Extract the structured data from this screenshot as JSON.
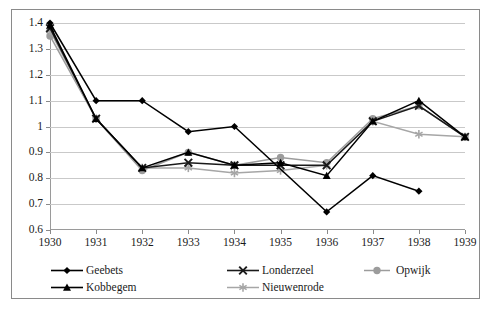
{
  "chart_data": {
    "type": "line",
    "title": "",
    "xlabel": "",
    "ylabel": "",
    "x": [
      1930,
      1931,
      1932,
      1933,
      1934,
      1935,
      1936,
      1937,
      1938,
      1939
    ],
    "xtick_labels": [
      "1930",
      "1931",
      "1932",
      "1933",
      "1934",
      "1935",
      "1936",
      "1937",
      "1938",
      "1939"
    ],
    "ytick_labels": [
      "0.6",
      "0.7",
      "0.8",
      "0.9",
      "1",
      "1.1",
      "1.2",
      "1.3",
      "1.4"
    ],
    "ytick_values": [
      0.6,
      0.7,
      0.8,
      0.9,
      1.0,
      1.1,
      1.2,
      1.3,
      1.4
    ],
    "ylim": [
      0.6,
      1.4
    ],
    "xlim": [
      1930,
      1939
    ],
    "grid": true,
    "legend_position": "bottom",
    "series": [
      {
        "name": "Geebets",
        "marker": "diamond",
        "color": "#000000",
        "x": [
          1930,
          1931,
          1932,
          1933,
          1934,
          1936,
          1937,
          1938
        ],
        "values": [
          1.4,
          1.1,
          1.1,
          0.98,
          1.0,
          0.67,
          0.81,
          0.75
        ]
      },
      {
        "name": "Kobbegem",
        "marker": "triangle",
        "color": "#000000",
        "x": [
          1930,
          1931,
          1932,
          1933,
          1934,
          1935,
          1936,
          1937,
          1938,
          1939
        ],
        "values": [
          1.39,
          1.03,
          0.84,
          0.9,
          0.85,
          0.86,
          0.81,
          1.02,
          1.1,
          0.96
        ]
      },
      {
        "name": "Londerzeel",
        "marker": "x",
        "color": "#1a1a1a",
        "x": [
          1930,
          1931,
          1932,
          1933,
          1934,
          1935,
          1936,
          1937,
          1938,
          1939
        ],
        "values": [
          1.38,
          1.03,
          0.84,
          0.86,
          0.85,
          0.85,
          0.85,
          1.02,
          1.08,
          0.96
        ]
      },
      {
        "name": "Nieuwenrode",
        "marker": "asterisk",
        "color": "#a6a6a6",
        "x": [
          1930,
          1931,
          1932,
          1933,
          1934,
          1935,
          1936,
          1937,
          1938,
          1939
        ],
        "values": [
          1.37,
          1.03,
          0.84,
          0.84,
          0.82,
          0.83,
          0.85,
          1.02,
          0.97,
          0.96
        ]
      },
      {
        "name": "Opwijk",
        "marker": "circle",
        "color": "#9c9c9c",
        "x": [
          1930,
          1931,
          1932,
          1933,
          1934,
          1935,
          1936,
          1937,
          1938,
          1939
        ],
        "values": [
          1.35,
          1.03,
          0.83,
          0.9,
          0.85,
          0.88,
          0.86,
          1.03,
          1.08,
          0.96
        ]
      }
    ]
  }
}
